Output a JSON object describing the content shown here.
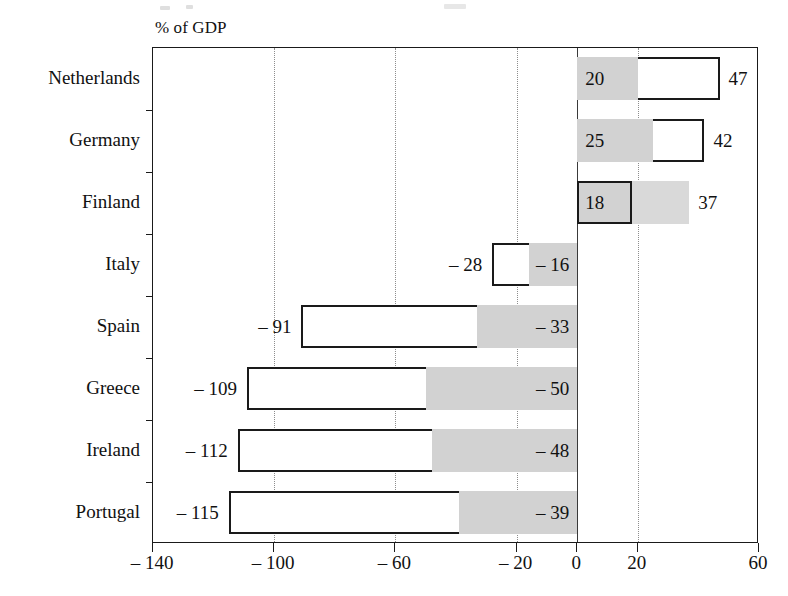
{
  "figure": {
    "axis_title": "% of GDP",
    "colors": {
      "outline": "#1a1a1a",
      "shade": "#d2d2d2",
      "ghost_shade": "#d9d9d9",
      "grid": "#8d8d8d",
      "background": "#ffffff"
    }
  },
  "chart_data": {
    "type": "bar",
    "orientation": "horizontal",
    "title": "",
    "xlabel": "% of GDP",
    "ylabel": "",
    "xlim": [
      -140,
      60
    ],
    "xticks": [
      -140,
      -100,
      -60,
      -20,
      0,
      20,
      60
    ],
    "xticklabels": [
      "– 140",
      "– 100",
      "– 60",
      "– 20",
      "0",
      "20",
      "60"
    ],
    "gridlines": [
      -100,
      -60,
      -20,
      20
    ],
    "grid": true,
    "legend": "none",
    "categories": [
      "Netherlands",
      "Germany",
      "Finland",
      "Italy",
      "Spain",
      "Greece",
      "Ireland",
      "Portugal"
    ],
    "series": [
      {
        "name": "total",
        "values": [
          47,
          42,
          37,
          -28,
          -91,
          -109,
          -112,
          -115
        ],
        "labels": [
          "47",
          "42",
          "37",
          "– 28",
          "– 91",
          "– 109",
          "– 112",
          "– 115"
        ]
      },
      {
        "name": "shaded",
        "values": [
          20,
          25,
          18,
          -16,
          -33,
          -50,
          -48,
          -39
        ],
        "labels": [
          "20",
          "25",
          "18",
          "– 16",
          "– 33",
          "– 50",
          "– 48",
          "– 39"
        ]
      }
    ],
    "rows": [
      {
        "category": "Netherlands",
        "total": 47,
        "total_label": "47",
        "shaded": 20,
        "shaded_label": "20",
        "style": "outer-outlined"
      },
      {
        "category": "Germany",
        "total": 42,
        "total_label": "42",
        "shaded": 25,
        "shaded_label": "25",
        "style": "outer-outlined"
      },
      {
        "category": "Finland",
        "total": 37,
        "total_label": "37",
        "shaded": 18,
        "shaded_label": "18",
        "style": "inner-outlined"
      },
      {
        "category": "Italy",
        "total": -28,
        "total_label": "– 28",
        "shaded": -16,
        "shaded_label": "– 16",
        "style": "outer-outlined"
      },
      {
        "category": "Spain",
        "total": -91,
        "total_label": "– 91",
        "shaded": -33,
        "shaded_label": "– 33",
        "style": "outer-outlined"
      },
      {
        "category": "Greece",
        "total": -109,
        "total_label": "– 109",
        "shaded": -50,
        "shaded_label": "– 50",
        "style": "outer-outlined"
      },
      {
        "category": "Ireland",
        "total": -112,
        "total_label": "– 112",
        "shaded": -48,
        "shaded_label": "– 48",
        "style": "outer-outlined"
      },
      {
        "category": "Portugal",
        "total": -115,
        "total_label": "– 115",
        "shaded": -39,
        "shaded_label": "– 39",
        "style": "outer-outlined"
      }
    ]
  }
}
